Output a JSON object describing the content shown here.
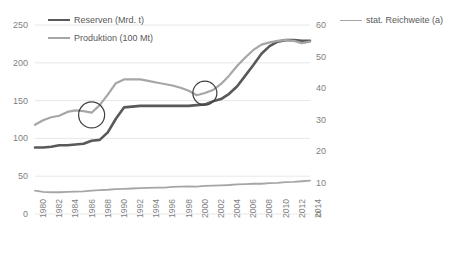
{
  "legend": {
    "entries": [
      {
        "label": "Reserven (Mrd. t)",
        "color": "#595959",
        "width": 2.6
      },
      {
        "label": "Produktion (100 Mt)",
        "color": "#a6a6a6",
        "width": 2.2
      },
      {
        "label": "stat. Reichweite (a)",
        "color": "#a6a6a6",
        "width": 1.8
      }
    ]
  },
  "axes": {
    "left": {
      "ticks": [
        "0",
        "50",
        "100",
        "150",
        "200",
        "250"
      ],
      "min": 0,
      "max": 250
    },
    "right": {
      "ticks": [
        "0",
        "10",
        "20",
        "30",
        "40",
        "50",
        "60"
      ],
      "min": 0,
      "max": 60
    },
    "x": {
      "ticks": [
        "1980",
        "1981",
        "1982",
        "1983",
        "1984",
        "1985",
        "1986",
        "1987",
        "1988",
        "1989",
        "1990",
        "1991",
        "1992",
        "1993",
        "1994",
        "1995",
        "1996",
        "1997",
        "1998",
        "1999",
        "2000",
        "2001",
        "2002",
        "2003",
        "2004",
        "2005",
        "2006",
        "2007",
        "2008",
        "2009",
        "2010",
        "2011",
        "2012",
        "2013",
        "2014"
      ],
      "visible_ticks": [
        "1980",
        "1982",
        "1984",
        "1986",
        "1988",
        "1990",
        "1992",
        "1994",
        "1996",
        "1998",
        "2000",
        "2002",
        "2004",
        "2006",
        "2008",
        "2010",
        "2012",
        "2014"
      ]
    }
  },
  "annotations": [
    {
      "name": "circle-1987",
      "x_year": 1987,
      "y_value": 131,
      "radius": 13
    },
    {
      "name": "circle-2001",
      "x_year": 2001,
      "y_value": 160,
      "radius": 12
    }
  ],
  "colors": {
    "grid": "#e8e8e8",
    "text": "#7f7f7f",
    "reserven": "#595959",
    "produktion": "#a6a6a6",
    "reichweite": "#a6a6a6",
    "annotation": "#404040",
    "background": "#ffffff"
  },
  "chart_data": {
    "type": "line",
    "title": "",
    "xlabel": "",
    "ylabel": "",
    "ylim": [
      0,
      250
    ],
    "y2lim": [
      0,
      60
    ],
    "grid": true,
    "legend_position": "top",
    "x": [
      1980,
      1981,
      1982,
      1983,
      1984,
      1985,
      1986,
      1987,
      1988,
      1989,
      1990,
      1991,
      1992,
      1993,
      1994,
      1995,
      1996,
      1997,
      1998,
      1999,
      2000,
      2001,
      2002,
      2003,
      2004,
      2005,
      2006,
      2007,
      2008,
      2009,
      2010,
      2011,
      2012,
      2013,
      2014
    ],
    "series": [
      {
        "name": "Reserven (Mrd. t)",
        "axis": "left",
        "color": "#595959",
        "values": [
          88,
          88,
          89,
          91,
          91,
          92,
          93,
          97,
          98,
          108,
          126,
          141,
          142,
          143,
          143,
          143,
          143,
          143,
          143,
          143,
          144,
          145,
          149,
          152,
          159,
          169,
          183,
          197,
          212,
          222,
          228,
          230,
          230,
          229,
          229
        ]
      },
      {
        "name": "Produktion (100 Mt)",
        "axis": "left",
        "color": "#a6a6a6",
        "values": [
          118,
          124,
          128,
          130,
          135,
          137,
          136,
          134,
          144,
          158,
          173,
          178,
          178,
          178,
          176,
          174,
          172,
          170,
          167,
          163,
          157,
          160,
          164,
          172,
          183,
          196,
          207,
          217,
          224,
          227,
          229,
          230,
          229,
          226,
          228
        ]
      },
      {
        "name": "stat. Reichweite (a)",
        "axis": "right",
        "color": "#a6a6a6",
        "values": [
          7.4,
          7.0,
          6.9,
          6.9,
          7.0,
          7.1,
          7.2,
          7.4,
          7.6,
          7.7,
          7.9,
          8.0,
          8.1,
          8.2,
          8.3,
          8.4,
          8.4,
          8.6,
          8.7,
          8.8,
          8.7,
          8.9,
          9.0,
          9.1,
          9.2,
          9.4,
          9.5,
          9.6,
          9.6,
          9.8,
          9.9,
          10.1,
          10.2,
          10.4,
          10.6
        ]
      }
    ]
  }
}
